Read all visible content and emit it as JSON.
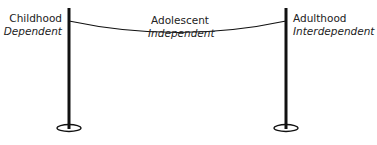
{
  "stages": [
    {
      "title": "Childhood",
      "subtitle": "Dependent"
    },
    {
      "title": "Adolescent",
      "subtitle": "Independent"
    },
    {
      "title": "Adulthood",
      "subtitle": "Interdependent"
    }
  ],
  "colors": {
    "line": "#111111",
    "text": "#222222"
  }
}
